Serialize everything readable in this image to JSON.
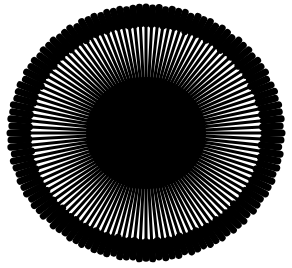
{
  "figure": {
    "background_color": "#ffffff",
    "width": 292,
    "height": 268,
    "title": "",
    "subtitle": ""
  },
  "chart_data": {
    "type": "bar",
    "variant": "polar-radial-rose",
    "title": "",
    "subtitle": "",
    "xlabel": "",
    "ylabel": "",
    "grid": false,
    "legend": null,
    "legend_position": "none",
    "axis_visible": false,
    "tick_labels": [],
    "annotations": [],
    "colors": {
      "bar": "#000000",
      "background": "#ffffff",
      "core": "#000000"
    },
    "polar": {
      "center_x": 146,
      "center_y": 133,
      "inner_radius_x": 60,
      "inner_radius_y": 56,
      "outer_radius_x": 136,
      "outer_radius_y": 126,
      "start_angle_deg": -90,
      "direction": "clockwise",
      "bar_count": 120,
      "angular_step_deg": 3.0,
      "bar_stem_width": 3.0,
      "bar_tip_width": 7.0,
      "tip_shape": "round-club",
      "tip_length_fraction": 0.22,
      "rlim": [
        0,
        1
      ]
    },
    "categories": [
      "0",
      "1",
      "2",
      "3",
      "4",
      "5",
      "6",
      "7",
      "8",
      "9",
      "10",
      "11",
      "12",
      "13",
      "14",
      "15",
      "16",
      "17",
      "18",
      "19",
      "20",
      "21",
      "22",
      "23",
      "24",
      "25",
      "26",
      "27",
      "28",
      "29",
      "30",
      "31",
      "32",
      "33",
      "34",
      "35",
      "36",
      "37",
      "38",
      "39",
      "40",
      "41",
      "42",
      "43",
      "44",
      "45",
      "46",
      "47",
      "48",
      "49",
      "50",
      "51",
      "52",
      "53",
      "54",
      "55",
      "56",
      "57",
      "58",
      "59",
      "60",
      "61",
      "62",
      "63",
      "64",
      "65",
      "66",
      "67",
      "68",
      "69",
      "70",
      "71",
      "72",
      "73",
      "74",
      "75",
      "76",
      "77",
      "78",
      "79",
      "80",
      "81",
      "82",
      "83",
      "84",
      "85",
      "86",
      "87",
      "88",
      "89",
      "90",
      "91",
      "92",
      "93",
      "94",
      "95",
      "96",
      "97",
      "98",
      "99",
      "100",
      "101",
      "102",
      "103",
      "104",
      "105",
      "106",
      "107",
      "108",
      "109",
      "110",
      "111",
      "112",
      "113",
      "114",
      "115",
      "116",
      "117",
      "118",
      "119"
    ],
    "values": [
      1.0,
      0.99,
      1.0,
      0.98,
      1.0,
      0.99,
      1.0,
      0.97,
      1.0,
      0.99,
      1.0,
      0.98,
      1.0,
      0.99,
      0.97,
      1.0,
      0.99,
      1.0,
      0.98,
      1.0,
      0.99,
      1.0,
      0.97,
      0.99,
      1.0,
      0.98,
      1.0,
      0.99,
      1.0,
      0.98,
      1.0,
      0.99,
      0.97,
      1.0,
      0.99,
      1.0,
      0.98,
      1.0,
      0.99,
      1.0,
      0.98,
      0.99,
      1.0,
      0.97,
      1.0,
      0.99,
      1.0,
      0.98,
      1.0,
      0.99,
      1.0,
      0.98,
      0.99,
      1.0,
      0.97,
      1.0,
      0.99,
      1.0,
      0.98,
      1.0,
      0.99,
      1.0,
      0.98,
      0.99,
      1.0,
      0.97,
      1.0,
      0.99,
      1.0,
      0.98,
      1.0,
      0.99,
      1.0,
      0.98,
      0.99,
      1.0,
      0.97,
      1.0,
      0.99,
      1.0,
      0.98,
      1.0,
      0.99,
      1.0,
      0.98,
      0.99,
      1.0,
      0.97,
      1.0,
      0.99,
      1.0,
      0.98,
      1.0,
      0.99,
      1.0,
      0.98,
      0.99,
      1.0,
      0.97,
      1.0,
      0.99,
      1.0,
      0.98,
      1.0,
      0.99,
      1.0,
      0.98,
      0.99,
      1.0,
      0.97,
      1.0,
      0.99,
      1.0,
      0.98,
      1.0,
      0.99,
      1.0,
      0.98,
      0.99,
      1.0
    ]
  }
}
